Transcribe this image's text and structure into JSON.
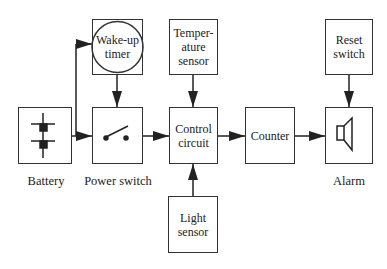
{
  "diagram": {
    "type": "block-diagram",
    "blocks": {
      "wakeup": {
        "line1": "Wake-up",
        "line2": "timer"
      },
      "temperature": {
        "line1": "Temper-",
        "line2": "ature",
        "line3": "sensor"
      },
      "reset": {
        "line1": "Reset",
        "line2": "switch"
      },
      "battery": {
        "label": "Battery"
      },
      "power": {
        "label": "Power switch"
      },
      "control": {
        "line1": "Control",
        "line2": "circuit"
      },
      "counter": {
        "label": "Counter"
      },
      "alarm": {
        "label": "Alarm"
      },
      "light": {
        "line1": "Light",
        "line2": "sensor"
      }
    },
    "connections": [
      {
        "from": "Battery",
        "to": "Wake-up timer"
      },
      {
        "from": "Battery",
        "to": "Power switch"
      },
      {
        "from": "Wake-up timer",
        "to": "Power switch"
      },
      {
        "from": "Power switch",
        "to": "Control circuit"
      },
      {
        "from": "Temperature sensor",
        "to": "Control circuit"
      },
      {
        "from": "Light sensor",
        "to": "Control circuit"
      },
      {
        "from": "Control circuit",
        "to": "Counter"
      },
      {
        "from": "Counter",
        "to": "Alarm"
      },
      {
        "from": "Reset switch",
        "to": "Alarm"
      }
    ]
  }
}
